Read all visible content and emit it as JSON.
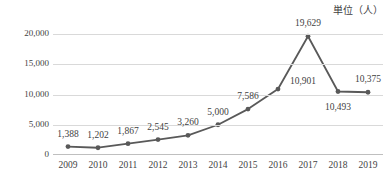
{
  "chart_data": {
    "type": "line",
    "title": "",
    "subtitle": "",
    "unit_caption": "単位（人）",
    "xlabel": "",
    "ylabel": "",
    "categories": [
      "2009",
      "2010",
      "2011",
      "2012",
      "2013",
      "2014",
      "2015",
      "2016",
      "2017",
      "2018",
      "2019"
    ],
    "values": [
      1388,
      1202,
      1867,
      2545,
      3260,
      5000,
      7586,
      10901,
      19629,
      10493,
      10375
    ],
    "value_labels": [
      "1,388",
      "1,202",
      "1,867",
      "2,545",
      "3,260",
      "5,000",
      "7,586",
      "10,901",
      "19,629",
      "10,493",
      "10,375"
    ],
    "label_placement": [
      "above",
      "above",
      "above",
      "above",
      "above",
      "above",
      "above",
      "right-above",
      "above",
      "below",
      "above"
    ],
    "ylim": [
      0,
      20000
    ],
    "ytick_values": [
      0,
      5000,
      10000,
      15000,
      20000
    ],
    "ytick_labels": [
      "0",
      "5,000",
      "10,000",
      "15,000",
      "20,000"
    ],
    "grid": true,
    "legend": "none",
    "series_color": "#595959",
    "marker_color": "#595959",
    "grid_color": "#d9d9d9",
    "text_color": "#3f3f3f",
    "markers": true,
    "data_labels": true
  }
}
